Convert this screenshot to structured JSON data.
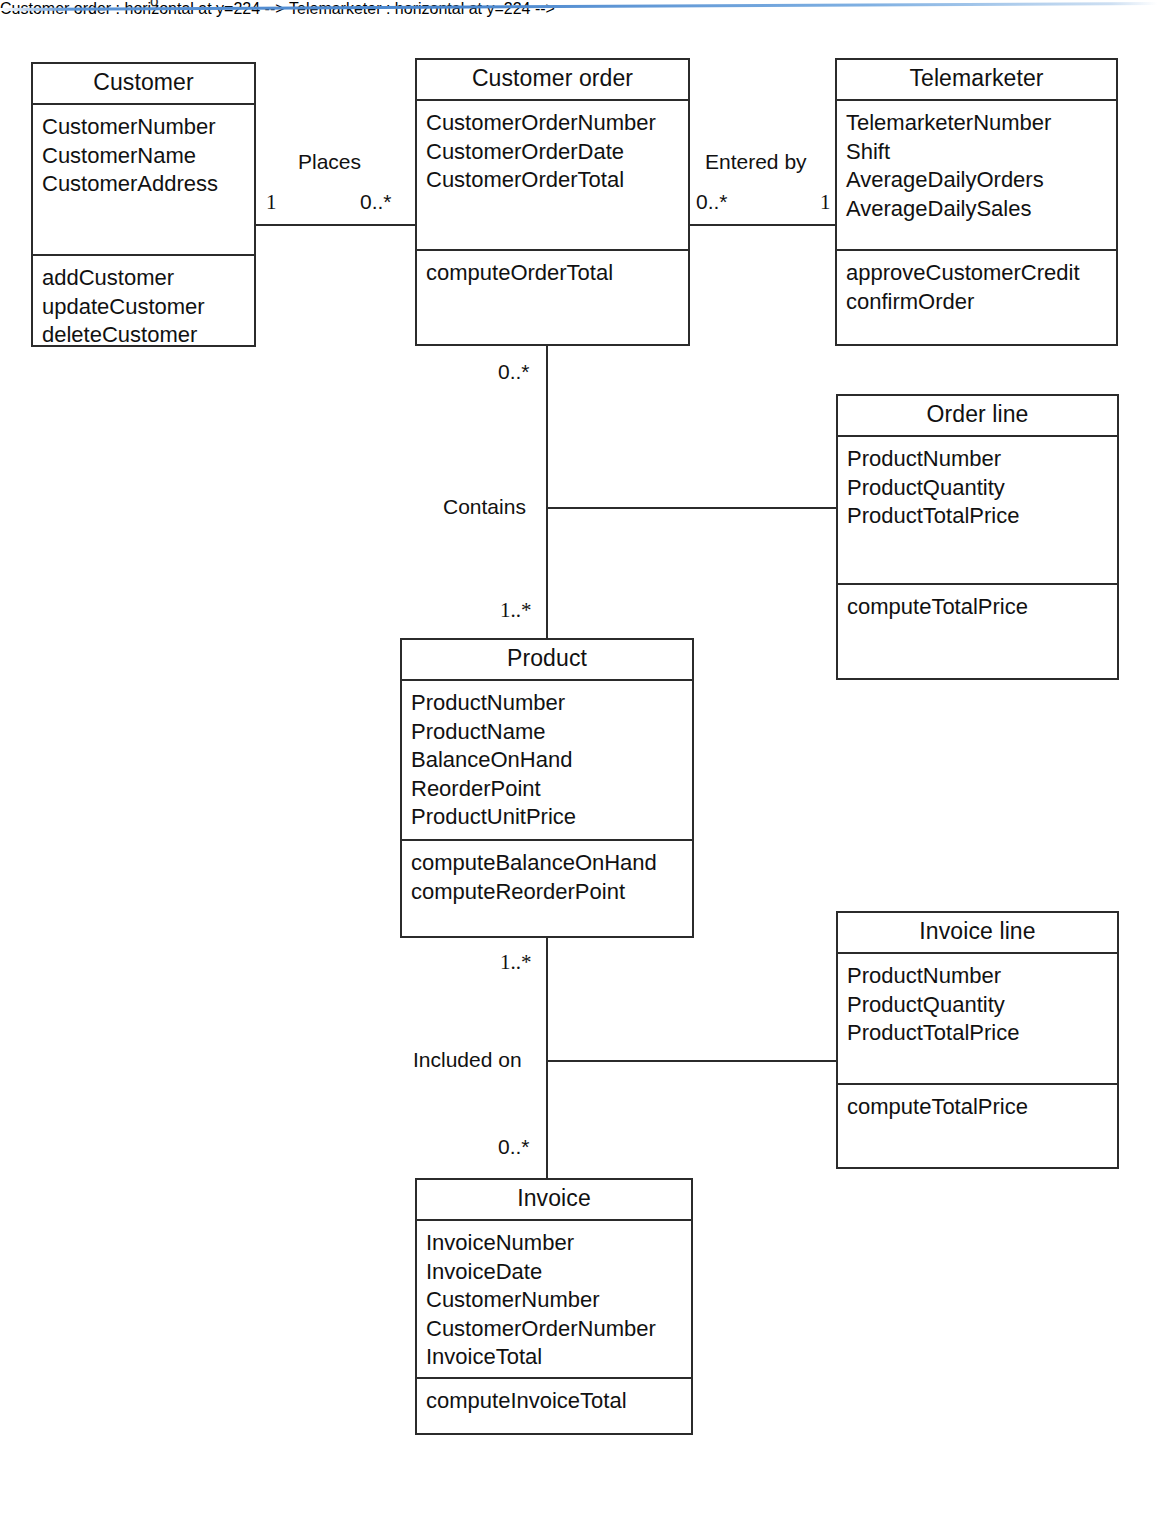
{
  "diagram": {
    "artifact_glyph": "o"
  },
  "classes": {
    "customer": {
      "name": "Customer",
      "attributes": [
        "CustomerNumber",
        "CustomerName",
        "CustomerAddress"
      ],
      "operations": [
        "addCustomer",
        "updateCustomer",
        "deleteCustomer"
      ]
    },
    "customer_order": {
      "name": "Customer order",
      "attributes": [
        "CustomerOrderNumber",
        "CustomerOrderDate",
        "CustomerOrderTotal"
      ],
      "operations": [
        "computeOrderTotal"
      ]
    },
    "telemarketer": {
      "name": "Telemarketer",
      "attributes": [
        "TelemarketerNumber",
        "Shift",
        "AverageDailyOrders",
        "AverageDailySales"
      ],
      "operations": [
        "approveCustomerCredit",
        "confirmOrder"
      ]
    },
    "order_line": {
      "name": "Order line",
      "attributes": [
        "ProductNumber",
        "ProductQuantity",
        "ProductTotalPrice"
      ],
      "operations": [
        "computeTotalPrice"
      ]
    },
    "product": {
      "name": "Product",
      "attributes": [
        "ProductNumber",
        "ProductName",
        "BalanceOnHand",
        "ReorderPoint",
        "ProductUnitPrice"
      ],
      "operations": [
        "computeBalanceOnHand",
        "computeReorderPoint"
      ]
    },
    "invoice_line": {
      "name": "Invoice line",
      "attributes": [
        "ProductNumber",
        "ProductQuantity",
        "ProductTotalPrice"
      ],
      "operations": [
        "computeTotalPrice"
      ]
    },
    "invoice": {
      "name": "Invoice",
      "attributes": [
        "InvoiceNumber",
        "InvoiceDate",
        "CustomerNumber",
        "CustomerOrderNumber",
        "InvoiceTotal"
      ],
      "operations": [
        "computeInvoiceTotal"
      ]
    }
  },
  "associations": {
    "places": {
      "label": "Places",
      "source_multiplicity": "1",
      "target_multiplicity": "0..*"
    },
    "entered_by": {
      "label": "Entered by",
      "source_multiplicity": "0..*",
      "target_multiplicity": "1"
    },
    "contains": {
      "label": "Contains",
      "source_multiplicity": "0..*",
      "target_multiplicity": "1..*"
    },
    "included_on": {
      "label": "Included on",
      "source_multiplicity": "1..*",
      "target_multiplicity": "0..*"
    }
  }
}
